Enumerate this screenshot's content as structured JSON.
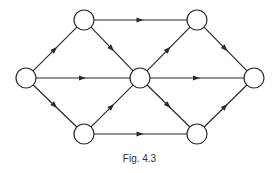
{
  "caption": "Fig. 4.3",
  "colors": {
    "stroke": "#2a2a2a",
    "node_fill": "#ffffff",
    "background": "#ffffff"
  },
  "node_radius": 10,
  "nodes": [
    {
      "id": "L",
      "x": 26,
      "y": 78
    },
    {
      "id": "TL",
      "x": 84,
      "y": 20
    },
    {
      "id": "TR",
      "x": 197,
      "y": 20
    },
    {
      "id": "C",
      "x": 140,
      "y": 78
    },
    {
      "id": "R",
      "x": 254,
      "y": 78
    },
    {
      "id": "BL",
      "x": 84,
      "y": 134
    },
    {
      "id": "BR",
      "x": 197,
      "y": 134
    }
  ],
  "edges": [
    {
      "from": "L",
      "to": "TL"
    },
    {
      "from": "L",
      "to": "C"
    },
    {
      "from": "L",
      "to": "BL"
    },
    {
      "from": "TL",
      "to": "TR"
    },
    {
      "from": "TL",
      "to": "C"
    },
    {
      "from": "BL",
      "to": "C"
    },
    {
      "from": "BL",
      "to": "BR"
    },
    {
      "from": "C",
      "to": "TR"
    },
    {
      "from": "C",
      "to": "R"
    },
    {
      "from": "C",
      "to": "BR"
    },
    {
      "from": "TR",
      "to": "R"
    },
    {
      "from": "BR",
      "to": "R"
    }
  ]
}
